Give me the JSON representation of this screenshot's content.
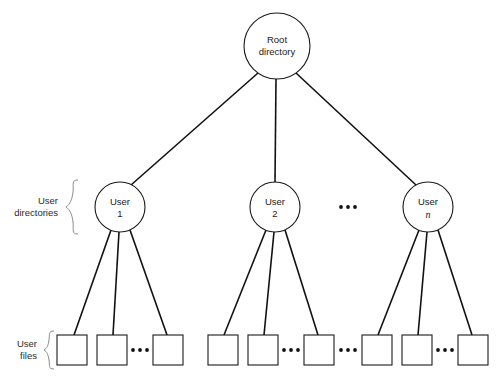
{
  "diagram": {
    "background_color": "#ffffff",
    "line_color": "#111111",
    "text_color": "#1a1a1a",
    "brace_color": "#8a8a8a",
    "root": {
      "label_line1": "Root",
      "label_line2": "directory",
      "cx": 277,
      "cy": 46,
      "r": 33
    },
    "group_labels": {
      "user_directories_line1": "User",
      "user_directories_line2": "directories",
      "user_files_line1": "User",
      "user_files_line2": "files"
    },
    "user_nodes": [
      {
        "label_line1": "User",
        "label_line2": "1",
        "italic": false,
        "cx": 120,
        "cy": 207,
        "r": 25
      },
      {
        "label_line1": "User",
        "label_line2": "2",
        "italic": false,
        "cx": 275,
        "cy": 207,
        "r": 25
      },
      {
        "label_line1": "User",
        "label_line2": "n",
        "italic": true,
        "cx": 428,
        "cy": 207,
        "r": 25
      }
    ],
    "user_ellipsis": {
      "label": "...",
      "cx": 348,
      "cy": 207
    },
    "file_groups": [
      {
        "owner": "User 1",
        "boxes": [
          {
            "x": 57,
            "y": 335,
            "w": 30,
            "h": 30
          },
          {
            "x": 97,
            "y": 335,
            "w": 30,
            "h": 30
          },
          {
            "x": 153,
            "y": 335,
            "w": 30,
            "h": 30
          }
        ],
        "ellipsis": {
          "label": "...",
          "cx": 139,
          "cy": 350
        }
      },
      {
        "owner": "User 2",
        "boxes": [
          {
            "x": 208,
            "y": 335,
            "w": 30,
            "h": 30
          },
          {
            "x": 248,
            "y": 335,
            "w": 30,
            "h": 30
          },
          {
            "x": 304,
            "y": 335,
            "w": 30,
            "h": 30
          }
        ],
        "ellipsis": {
          "label": "...",
          "cx": 290,
          "cy": 350
        }
      },
      {
        "owner": "User n",
        "boxes": [
          {
            "x": 362,
            "y": 335,
            "w": 30,
            "h": 30
          },
          {
            "x": 402,
            "y": 335,
            "w": 30,
            "h": 30
          },
          {
            "x": 458,
            "y": 335,
            "w": 30,
            "h": 30
          }
        ],
        "ellipsis": {
          "label": "...",
          "cx": 444,
          "cy": 350
        }
      }
    ],
    "group_separator_ellipsis": {
      "label": "...",
      "cx": 348,
      "cy": 350
    }
  }
}
